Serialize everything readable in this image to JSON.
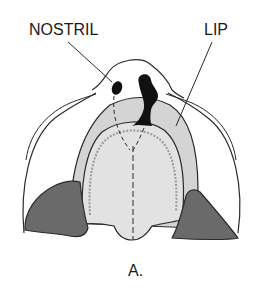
{
  "labels": {
    "nostril": "NOSTRIL",
    "lip": "LIP",
    "caption": "A."
  },
  "colors": {
    "outline": "#2a2a2a",
    "lip_fill": "#d4d4d4",
    "palate_fill": "#e2e2e2",
    "dark_fill": "#6a6a6a",
    "nostril_fill": "#111111",
    "background": "#ffffff"
  }
}
